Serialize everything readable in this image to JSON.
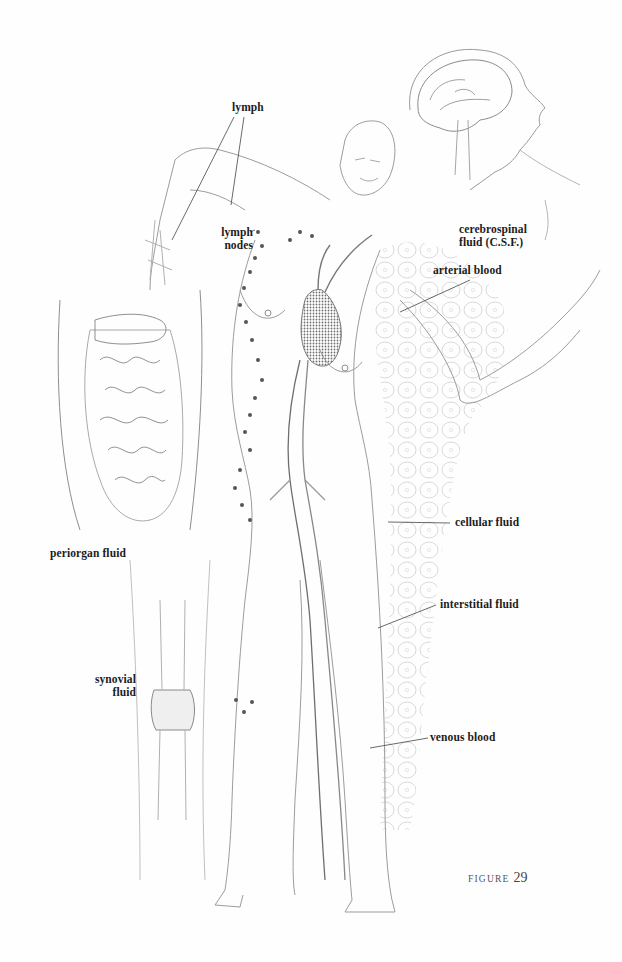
{
  "figure": {
    "caption_word": "Figure",
    "caption_number": "29"
  },
  "labels": {
    "lymph": "lymph",
    "lymph_nodes_line1": "lymph",
    "lymph_nodes_line2": "nodes",
    "csf_line1": "cerebrospinal",
    "csf_line2": "fluid (C.S.F.)",
    "arterial_blood": "arterial blood",
    "periorgan_fluid": "periorgan fluid",
    "cellular_fluid": "cellular fluid",
    "interstitial_fluid": "interstitial fluid",
    "synovial_line1": "synovial",
    "synovial_line2": "fluid",
    "venous_blood": "venous blood"
  },
  "colors": {
    "ink": "#1c1c1c",
    "pencil": "#8a8a8a",
    "light_pencil": "#c4c4c4",
    "caption": "#555555"
  }
}
